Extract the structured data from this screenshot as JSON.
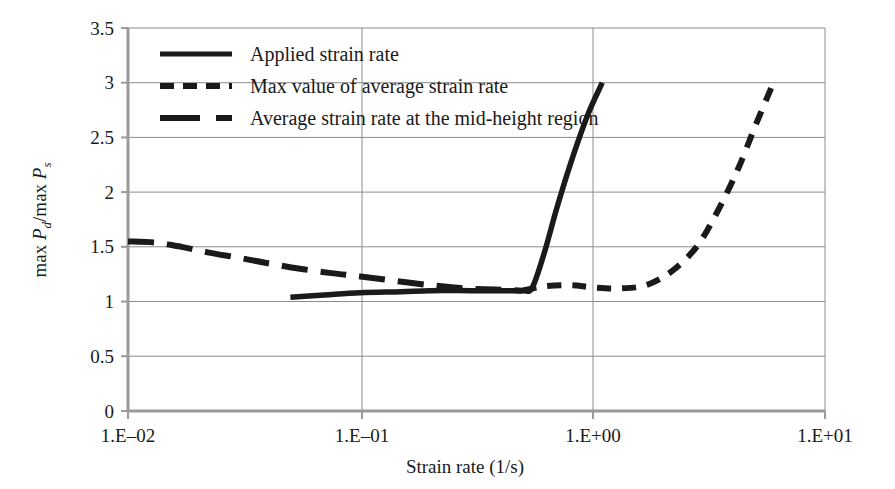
{
  "figure": {
    "background_color": "#ffffff",
    "ink_color": "#1a1a1a",
    "grid_color": "#8c8c8c",
    "axis_color": "#9a9a9a"
  },
  "axes": {
    "x_label": "Strain rate (1/s)",
    "x_tick_labels": [
      "1.E–02",
      "1.E–01",
      "1.E+00",
      "1.E+01"
    ],
    "y_tick_labels": [
      "0",
      "0.5",
      "1",
      "1.5",
      "2",
      "2.5",
      "3",
      "3.5"
    ],
    "y_label_parts": {
      "max1": "max ",
      "p_d": "P",
      "sub_d": "d",
      "slash": "/max ",
      "p_s": "P",
      "sub_s": "s"
    },
    "y_label_plain": "max Pd/max Ps"
  },
  "legend": {
    "position": "top-left-inside",
    "items": [
      {
        "label": "Applied strain rate",
        "style": "solid",
        "swatch": "legend-swatch-solid"
      },
      {
        "label": "Max value of average strain rate",
        "style": "short-dash",
        "swatch": "legend-swatch-short-dash"
      },
      {
        "label": "Average strain rate at the mid-height region",
        "style": "long-dash",
        "swatch": "legend-swatch-long-dash"
      }
    ]
  },
  "chart_data": {
    "type": "line",
    "title": "",
    "xlabel": "Strain rate (1/s)",
    "ylabel": "max Pd/max Ps",
    "x_scale": "log",
    "xlim": [
      0.01,
      10
    ],
    "ylim": [
      0,
      3.5
    ],
    "x_ticks": [
      0.01,
      0.1,
      1,
      10
    ],
    "x_tick_labels": [
      "1.E–02",
      "1.E–01",
      "1.E+00",
      "1.E+01"
    ],
    "y_ticks": [
      0,
      0.5,
      1,
      1.5,
      2,
      2.5,
      3,
      3.5
    ],
    "grid": "horizontal-and-vertical",
    "legend_position": "upper left",
    "series": [
      {
        "name": "Applied strain rate",
        "style": "solid",
        "x": [
          0.05,
          0.07,
          0.1,
          0.15,
          0.2,
          0.3,
          0.4,
          0.5,
          0.55,
          0.62,
          0.7,
          0.8,
          0.95,
          1.1
        ],
        "y": [
          1.04,
          1.06,
          1.08,
          1.09,
          1.1,
          1.1,
          1.1,
          1.1,
          1.13,
          1.45,
          1.85,
          2.25,
          2.7,
          3.0
        ]
      },
      {
        "name": "Max value of average strain rate",
        "style": "short-dash",
        "x": [
          0.5,
          0.62,
          0.8,
          1.0,
          1.3,
          1.7,
          2.2,
          2.8,
          3.4,
          4.2,
          5.0,
          5.6,
          6.0
        ],
        "y": [
          1.1,
          1.14,
          1.15,
          1.13,
          1.12,
          1.15,
          1.28,
          1.5,
          1.8,
          2.2,
          2.6,
          2.85,
          3.0
        ]
      },
      {
        "name": "Average strain rate at the mid-height region",
        "style": "long-dash",
        "x": [
          0.01,
          0.013,
          0.017,
          0.022,
          0.03,
          0.04,
          0.055,
          0.075,
          0.1,
          0.14,
          0.2,
          0.28,
          0.38,
          0.5
        ],
        "y": [
          1.55,
          1.54,
          1.5,
          1.45,
          1.4,
          1.35,
          1.3,
          1.26,
          1.23,
          1.19,
          1.15,
          1.12,
          1.11,
          1.1
        ]
      }
    ]
  },
  "geometry": {
    "plot_left": 128,
    "plot_right": 825,
    "plot_top": 28,
    "plot_bottom": 411
  }
}
